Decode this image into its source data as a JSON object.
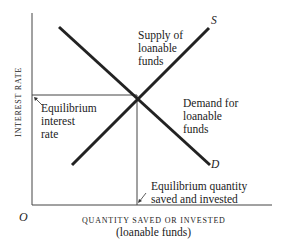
{
  "diagram": {
    "type": "supply-demand",
    "y_axis_label": "INTEREST RATE",
    "x_axis_label": "QUANTITY SAVED OR INVESTED",
    "x_axis_sublabel": "(loanable funds)",
    "origin_label": "O",
    "supply": {
      "curve_letter": "S",
      "label_lines": [
        "Supply of",
        "loanable",
        "funds"
      ]
    },
    "demand": {
      "curve_letter": "D",
      "label_lines": [
        "Demand for",
        "loanable",
        "funds"
      ]
    },
    "equilibrium_rate": {
      "label_lines": [
        "Equilibrium",
        "interest",
        "rate"
      ]
    },
    "equilibrium_quantity": {
      "label_lines": [
        "Equilibrium quantity",
        "saved and invested"
      ]
    }
  }
}
